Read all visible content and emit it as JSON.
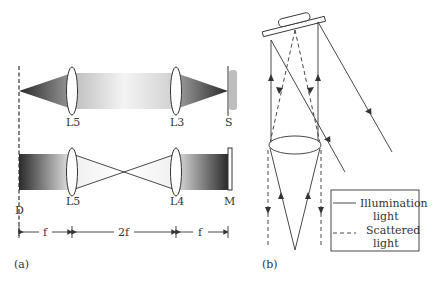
{
  "panel_a": {
    "caption": "(a)",
    "top_row": {
      "lens_left": "L5",
      "lens_right": "L3",
      "sample": "S"
    },
    "bottom_row": {
      "lens_left": "L5",
      "lens_right": "L4",
      "mirror": "M",
      "detector": "D"
    },
    "dimensions": {
      "left": "f",
      "middle": "2f",
      "right": "f"
    }
  },
  "panel_b": {
    "caption": "(b)",
    "legend": {
      "solid_label_1": "Illumination",
      "solid_label_2": "light",
      "dashed_label_1": "Scattered",
      "dashed_label_2": "light"
    }
  },
  "colors": {
    "line": "#333333",
    "dark_gradient": "#3a3a3a",
    "sample": "#bdbdbd"
  }
}
